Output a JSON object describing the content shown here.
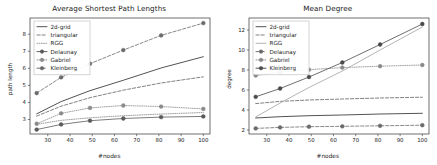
{
  "figure": {
    "background": "#ffffff",
    "panels": [
      "left",
      "right"
    ]
  },
  "left_panel": {
    "title": "Average Shortest Path Lengths",
    "xlabel": "#nodes",
    "ylabel": "path length",
    "legend": [
      {
        "label": "2d-grid",
        "style": "solid",
        "marker": "none"
      },
      {
        "label": "triangular",
        "style": "dashed",
        "marker": "none"
      },
      {
        "label": "RGG",
        "style": "dotted",
        "marker": "none"
      },
      {
        "label": "Delaunay",
        "style": "solid",
        "marker": "circle"
      },
      {
        "label": "Gabriel",
        "style": "dotted",
        "marker": "circle"
      },
      {
        "label": "Kleinberg",
        "style": "dashed",
        "marker": "circle"
      }
    ],
    "xticks": [
      "30",
      "40",
      "50",
      "60",
      "70",
      "80",
      "90",
      "100"
    ],
    "yticks": [
      "3",
      "4",
      "5",
      "6",
      "7",
      "8"
    ]
  },
  "right_panel": {
    "title": "Mean Degree",
    "xlabel": "#nodes",
    "ylabel": "degree",
    "legend": [
      {
        "label": "2d-grid",
        "style": "solid",
        "marker": "none"
      },
      {
        "label": "triangular",
        "style": "dashed",
        "marker": "none"
      },
      {
        "label": "RGG",
        "style": "solid",
        "marker": "none"
      },
      {
        "label": "Delaunay",
        "style": "dashed",
        "marker": "circle"
      },
      {
        "label": "Gabriel",
        "style": "dotted",
        "marker": "circle"
      },
      {
        "label": "Kleinberg",
        "style": "solid",
        "marker": "circle"
      }
    ],
    "xticks": [
      "30",
      "40",
      "50",
      "60",
      "70",
      "80",
      "90",
      "100"
    ],
    "yticks": [
      "2",
      "4",
      "6",
      "8",
      "10",
      "12"
    ]
  },
  "chart_data": [
    {
      "type": "line",
      "title": "Average Shortest Path Lengths",
      "xlabel": "#nodes",
      "ylabel": "path length",
      "xlim": [
        22,
        103
      ],
      "ylim": [
        2.15,
        8.95
      ],
      "xticks": [
        30,
        40,
        50,
        60,
        70,
        80,
        90,
        100
      ],
      "yticks": [
        3,
        4,
        5,
        6,
        7,
        8
      ],
      "grid": false,
      "legend_position": "upper-left",
      "x": [
        25,
        36,
        49,
        64,
        81,
        100
      ],
      "series": [
        {
          "name": "2d-grid",
          "style": "solid",
          "marker": "none",
          "color": "#4a4a4a",
          "values": [
            3.33,
            4.05,
            4.69,
            5.3,
            6.02,
            6.68
          ]
        },
        {
          "name": "triangular",
          "style": "dashed",
          "marker": "none",
          "color": "#7a7a7a",
          "values": [
            3.2,
            3.78,
            4.28,
            4.72,
            5.14,
            5.5
          ]
        },
        {
          "name": "RGG",
          "style": "dotted",
          "marker": "none",
          "color": "#9a9a9a",
          "values": [
            2.72,
            2.95,
            3.1,
            3.22,
            3.32,
            3.41
          ]
        },
        {
          "name": "Delaunay",
          "style": "solid",
          "marker": "circle",
          "color": "#5a5a5a",
          "values": [
            2.41,
            2.71,
            2.93,
            3.06,
            3.14,
            3.18
          ]
        },
        {
          "name": "Gabriel",
          "style": "dotted",
          "marker": "circle",
          "color": "#8a8a8a",
          "values": [
            2.75,
            3.36,
            3.68,
            3.82,
            3.76,
            3.62
          ]
        },
        {
          "name": "Kleinberg",
          "style": "dashed",
          "marker": "circle",
          "color": "#6a6a6a",
          "values": [
            4.55,
            5.47,
            6.27,
            7.07,
            7.93,
            8.65
          ]
        }
      ]
    },
    {
      "type": "line",
      "title": "Mean Degree",
      "xlabel": "#nodes",
      "ylabel": "degree",
      "xlim": [
        22,
        103
      ],
      "ylim": [
        1.6,
        13.2
      ],
      "xticks": [
        30,
        40,
        50,
        60,
        70,
        80,
        90,
        100
      ],
      "yticks": [
        2,
        4,
        6,
        8,
        10,
        12
      ],
      "grid": false,
      "legend_position": "upper-left",
      "x": [
        25,
        36,
        49,
        64,
        81,
        100
      ],
      "series": [
        {
          "name": "2d-grid",
          "style": "solid",
          "marker": "none",
          "color": "#4a4a4a",
          "values": [
            3.2,
            3.33,
            3.43,
            3.5,
            3.6,
            3.67
          ]
        },
        {
          "name": "triangular",
          "style": "dashed",
          "marker": "none",
          "color": "#7a7a7a",
          "values": [
            4.64,
            4.86,
            5.0,
            5.1,
            5.2,
            5.28
          ]
        },
        {
          "name": "RGG",
          "style": "solid",
          "marker": "none",
          "color": "#b0b0b0",
          "values": [
            3.3,
            4.7,
            6.25,
            7.9,
            10.0,
            12.3
          ]
        },
        {
          "name": "Delaunay",
          "style": "dashed",
          "marker": "circle",
          "color": "#6a6a6a",
          "values": [
            2.16,
            2.26,
            2.33,
            2.37,
            2.42,
            2.48
          ]
        },
        {
          "name": "Gabriel",
          "style": "dotted",
          "marker": "circle",
          "color": "#8a8a8a",
          "values": [
            7.45,
            7.78,
            8.03,
            8.24,
            8.38,
            8.5
          ]
        },
        {
          "name": "Kleinberg",
          "style": "solid",
          "marker": "circle",
          "color": "#4a4a4a",
          "values": [
            5.32,
            6.15,
            7.3,
            8.75,
            10.55,
            12.6
          ]
        }
      ]
    }
  ]
}
